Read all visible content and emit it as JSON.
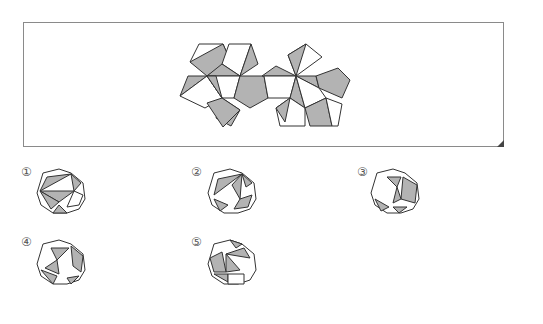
{
  "problem": {
    "type": "net-to-solid matching",
    "net_label": "net",
    "colors": {
      "shaded": "#b3b3b3",
      "face": "#ffffff",
      "stroke": "#333333",
      "frame": "#8a8a8a"
    }
  },
  "options": [
    {
      "label": "①",
      "id": 1
    },
    {
      "label": "②",
      "id": 2
    },
    {
      "label": "③",
      "id": 3
    },
    {
      "label": "④",
      "id": 4
    },
    {
      "label": "⑤",
      "id": 5
    }
  ],
  "net_polygons": [
    {
      "pts": "199,44 223,44 214,75 190,62",
      "fill": "face"
    },
    {
      "pts": "223,44 230,60 214,75",
      "fill": "face"
    },
    {
      "pts": "190,62 223,44 230,60 207,76",
      "fill": "shaded"
    },
    {
      "pts": "229,44 251,44 240,76 222,64",
      "fill": "face"
    },
    {
      "pts": "251,44 258,64 240,76",
      "fill": "shaded"
    },
    {
      "pts": "222,64 240,76 207,76",
      "fill": "shaded"
    },
    {
      "pts": "188,76 207,76 180,96",
      "fill": "shaded"
    },
    {
      "pts": "180,96 207,76 222,98 205,108",
      "fill": "face"
    },
    {
      "pts": "207,76 240,76 234,98 222,98",
      "fill": "face"
    },
    {
      "pts": "207,76 216,76 222,98",
      "fill": "shaded"
    },
    {
      "pts": "240,76 264,76 268,98 250,108 234,98",
      "fill": "shaded"
    },
    {
      "pts": "222,98 240,110 231,126 216,118",
      "fill": "shaded"
    },
    {
      "pts": "207,103 222,98 240,110 223,127",
      "fill": "shaded"
    },
    {
      "pts": "262,76 276,66 296,76",
      "fill": "shaded"
    },
    {
      "pts": "264,76 296,76 290,98 268,98",
      "fill": "face"
    },
    {
      "pts": "296,76 288,55 306,44 322,57",
      "fill": "face"
    },
    {
      "pts": "296,76 288,55 306,44",
      "fill": "shaded"
    },
    {
      "pts": "296,76 316,76 319,88",
      "fill": "shaded"
    },
    {
      "pts": "316,76 338,68 350,80 342,98 319,88",
      "fill": "shaded"
    },
    {
      "pts": "296,76 290,98 305,108",
      "fill": "shaded"
    },
    {
      "pts": "296,76 319,88 326,98 305,108",
      "fill": "face"
    },
    {
      "pts": "290,98 276,108 280,126 305,126 305,108",
      "fill": "face"
    },
    {
      "pts": "290,98 276,108 285,122",
      "fill": "shaded"
    },
    {
      "pts": "305,108 326,98 332,126 310,126",
      "fill": "shaded"
    },
    {
      "pts": "326,98 342,104 338,126 332,126",
      "fill": "face"
    }
  ],
  "solids": [
    {
      "cx": 61,
      "cy": 191,
      "polys": [
        {
          "pts": "-18,-18 -2,-22 10,-18 22,-8 24,8 18,18 6,22 -8,22 -20,14 -24,2",
          "fill": "face"
        },
        {
          "pts": "-14,-14 10,-17 -21,0",
          "fill": "shaded"
        },
        {
          "pts": "-21,0 13,0 -2,11",
          "fill": "shaded"
        },
        {
          "pts": "-21,0 -2,11 -10,18",
          "fill": "shaded"
        },
        {
          "pts": "10,-17 20,-8 13,0",
          "fill": "shaded"
        },
        {
          "pts": "-2,14 6,22 -8,22",
          "fill": "shaded"
        },
        {
          "pts": "13,0 22,4 18,14 6,16",
          "fill": "face"
        }
      ]
    },
    {
      "cx": 232,
      "cy": 191,
      "polys": [
        {
          "pts": "-18,-18 -2,-22 10,-18 22,-8 24,8 18,18 6,22 -8,22 -20,14 -24,2",
          "fill": "face"
        },
        {
          "pts": "-14,-12 10,-17 -18,4",
          "fill": "shaded"
        },
        {
          "pts": "10,-17 8,8 0,-6",
          "fill": "shaded"
        },
        {
          "pts": "8,8 20,4 16,16 2,18",
          "fill": "shaded"
        },
        {
          "pts": "-18,8 -4,14 -12,20",
          "fill": "shaded"
        },
        {
          "pts": "10,-17 20,-8 14,-4",
          "fill": "shaded"
        }
      ]
    },
    {
      "cx": 395,
      "cy": 191,
      "polys": [
        {
          "pts": "-18,-18 -2,-22 10,-18 22,-8 24,8 18,18 6,22 -8,22 -20,14 -24,2",
          "fill": "face"
        },
        {
          "pts": "-8,-14 6,-14 2,-4",
          "fill": "shaded"
        },
        {
          "pts": "8,-14 22,-6 20,12 6,8",
          "fill": "shaded"
        },
        {
          "pts": "2,-4 6,8 -2,12",
          "fill": "shaded"
        },
        {
          "pts": "-20,8 -6,16 -14,20",
          "fill": "shaded"
        },
        {
          "pts": "-2,16 12,16 4,22",
          "fill": "shaded"
        }
      ]
    },
    {
      "cx": 61,
      "cy": 262,
      "polys": [
        {
          "pts": "-18,-18 -2,-22 10,-18 22,-8 24,8 18,18 6,22 -8,22 -20,14 -24,2",
          "fill": "face"
        },
        {
          "pts": "-10,-14 8,-14 -4,-2",
          "fill": "shaded"
        },
        {
          "pts": "10,-16 22,-6 20,10 12,4",
          "fill": "shaded"
        },
        {
          "pts": "-4,-2 -16,6 -2,12",
          "fill": "shaded"
        },
        {
          "pts": "-20,8 -4,14 -8,22",
          "fill": "shaded"
        },
        {
          "pts": "6,16 18,14 10,22",
          "fill": "shaded"
        }
      ]
    },
    {
      "cx": 232,
      "cy": 262,
      "polys": [
        {
          "pts": "-18,-18 -2,-22 10,-18 22,-8 24,8 18,18 6,22 -8,22 -20,14 -24,2",
          "fill": "face"
        },
        {
          "pts": "-2,-22 10,-18 4,-14",
          "fill": "shaded"
        },
        {
          "pts": "-6,-8 12,-14 18,-4",
          "fill": "shaded"
        },
        {
          "pts": "-6,-8 8,8 -6,10",
          "fill": "shaded"
        },
        {
          "pts": "-22,-4 -10,-10 -6,10 -18,10",
          "fill": "shaded"
        },
        {
          "pts": "-18,12 -4,12 -4,20",
          "fill": "shaded"
        },
        {
          "pts": "-4,12 12,12 12,22 -4,22",
          "fill": "face"
        }
      ]
    }
  ],
  "option_positions": [
    {
      "x": 21,
      "y": 166
    },
    {
      "x": 191,
      "y": 166
    },
    {
      "x": 357,
      "y": 166
    },
    {
      "x": 21,
      "y": 236
    },
    {
      "x": 191,
      "y": 236
    }
  ]
}
